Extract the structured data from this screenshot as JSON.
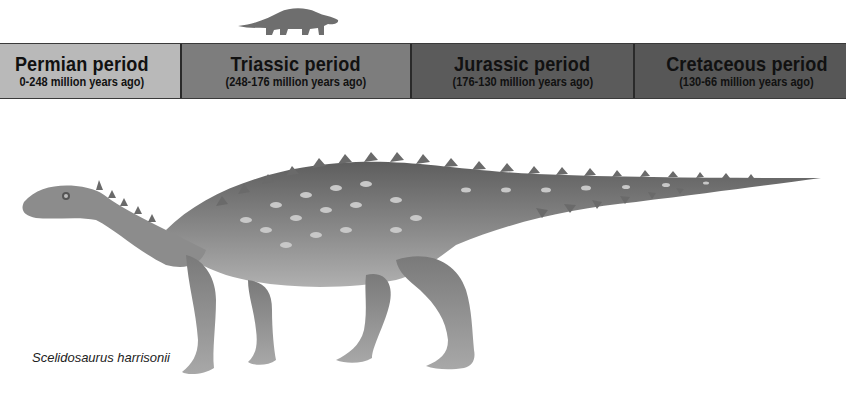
{
  "timeline": {
    "periods": [
      {
        "name": "Permian period",
        "range": "(290-248 million years ago)",
        "color": "#b9b9b9",
        "visible_range": "0-248 million years ago)"
      },
      {
        "name": "Triassic period",
        "range": "(248-176 million years ago)",
        "color": "#7d7d7d"
      },
      {
        "name": "Jurassic period",
        "range": "(176-130 million years ago)",
        "color": "#5b5b5b"
      },
      {
        "name": "Cretaceous period",
        "range": "(130-66 million years ago)",
        "color": "#575757"
      }
    ],
    "highlighted_period": "Triassic period"
  },
  "indicator": {
    "icon": "dinosaur-silhouette-icon",
    "color": "#6e6e6e"
  },
  "illustration": {
    "subject": "dinosaur-illustration"
  },
  "caption": {
    "text": "Scelidosaurus harrisonii"
  }
}
